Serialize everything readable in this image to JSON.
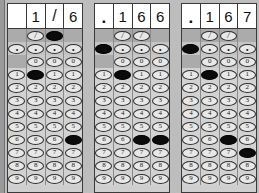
{
  "sheet": {
    "title": "grid-in-answer-sheets",
    "rows_labels": [
      "/",
      ".",
      "0",
      "1",
      "2",
      "3",
      "4",
      "5",
      "6",
      "7",
      "8",
      "9"
    ],
    "bubble_colors": {
      "fill": "#0b0b0b",
      "empty": "#e8e8e8",
      "border": "#2e2e2e"
    }
  },
  "grids": [
    {
      "id": "grid-1",
      "written": [
        "",
        "1",
        "/",
        "6"
      ],
      "columns": [
        {
          "index": 1,
          "has_slash": false,
          "has_dot": true,
          "has_zero": false,
          "digits": [
            "1",
            "2",
            "3",
            "4",
            "5",
            "6",
            "7",
            "8",
            "9"
          ],
          "filled": null
        },
        {
          "index": 2,
          "has_slash": true,
          "has_dot": true,
          "has_zero": true,
          "digits": [
            "0",
            "1",
            "2",
            "3",
            "4",
            "5",
            "6",
            "7",
            "8",
            "9"
          ],
          "filled": "1"
        },
        {
          "index": 3,
          "has_slash": true,
          "has_dot": true,
          "has_zero": true,
          "digits": [
            "0",
            "1",
            "2",
            "3",
            "4",
            "5",
            "6",
            "7",
            "8",
            "9"
          ],
          "filled": "/"
        },
        {
          "index": 4,
          "has_slash": false,
          "has_dot": true,
          "has_zero": true,
          "digits": [
            "0",
            "1",
            "2",
            "3",
            "4",
            "5",
            "6",
            "7",
            "8",
            "9"
          ],
          "filled": "6"
        }
      ]
    },
    {
      "id": "grid-2",
      "written": [
        ".",
        "1",
        "6",
        "6"
      ],
      "columns": [
        {
          "index": 1,
          "has_slash": false,
          "has_dot": true,
          "has_zero": false,
          "digits": [
            "1",
            "2",
            "3",
            "4",
            "5",
            "6",
            "7",
            "8",
            "9"
          ],
          "filled": "."
        },
        {
          "index": 2,
          "has_slash": true,
          "has_dot": true,
          "has_zero": true,
          "digits": [
            "0",
            "1",
            "2",
            "3",
            "4",
            "5",
            "6",
            "7",
            "8",
            "9"
          ],
          "filled": "1"
        },
        {
          "index": 3,
          "has_slash": true,
          "has_dot": true,
          "has_zero": true,
          "digits": [
            "0",
            "1",
            "2",
            "3",
            "4",
            "5",
            "6",
            "7",
            "8",
            "9"
          ],
          "filled": "6"
        },
        {
          "index": 4,
          "has_slash": false,
          "has_dot": true,
          "has_zero": true,
          "digits": [
            "0",
            "1",
            "2",
            "3",
            "4",
            "5",
            "6",
            "7",
            "8",
            "9"
          ],
          "filled": "6"
        }
      ]
    },
    {
      "id": "grid-3",
      "written": [
        ".",
        "1",
        "6",
        "7"
      ],
      "columns": [
        {
          "index": 1,
          "has_slash": false,
          "has_dot": true,
          "has_zero": false,
          "digits": [
            "1",
            "2",
            "3",
            "4",
            "5",
            "6",
            "7",
            "8",
            "9"
          ],
          "filled": "."
        },
        {
          "index": 2,
          "has_slash": true,
          "has_dot": true,
          "has_zero": true,
          "digits": [
            "0",
            "1",
            "2",
            "3",
            "4",
            "5",
            "6",
            "7",
            "8",
            "9"
          ],
          "filled": "1"
        },
        {
          "index": 3,
          "has_slash": true,
          "has_dot": true,
          "has_zero": true,
          "digits": [
            "0",
            "1",
            "2",
            "3",
            "4",
            "5",
            "6",
            "7",
            "8",
            "9"
          ],
          "filled": "6"
        },
        {
          "index": 4,
          "has_slash": false,
          "has_dot": true,
          "has_zero": true,
          "digits": [
            "0",
            "1",
            "2",
            "3",
            "4",
            "5",
            "6",
            "7",
            "8",
            "9"
          ],
          "filled": "7"
        }
      ]
    }
  ]
}
